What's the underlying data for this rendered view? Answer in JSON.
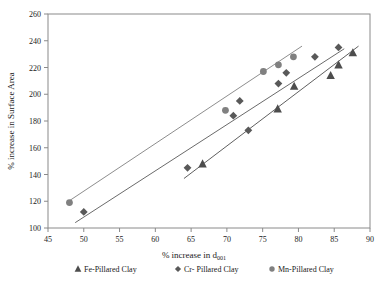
{
  "chart_data": {
    "type": "scatter",
    "title": "",
    "xlabel": "% increase in d001",
    "xlabel_main": "% increase in d",
    "xlabel_sub": "001",
    "ylabel": "% increase in Surface Area",
    "xlim": [
      45,
      90
    ],
    "ylim": [
      100,
      260
    ],
    "xticks": [
      45,
      50,
      55,
      60,
      65,
      70,
      75,
      80,
      85,
      90
    ],
    "yticks": [
      100,
      120,
      140,
      160,
      180,
      200,
      220,
      240,
      260
    ],
    "grid": false,
    "legend_position": "bottom",
    "series": [
      {
        "name": "Fe-Pillared Clay",
        "marker": "triangle",
        "color": "#4d4d4d",
        "points": [
          {
            "x": 66.6,
            "y": 148
          },
          {
            "x": 77.1,
            "y": 189
          },
          {
            "x": 79.4,
            "y": 206
          },
          {
            "x": 84.5,
            "y": 214
          },
          {
            "x": 85.6,
            "y": 222
          },
          {
            "x": 87.6,
            "y": 231
          }
        ],
        "trendline": {
          "x1": 64.0,
          "y1": 137,
          "x2": 88.4,
          "y2": 236
        }
      },
      {
        "name": "Cr- Pillared Clay",
        "marker": "diamond",
        "color": "#595959",
        "points": [
          {
            "x": 50.0,
            "y": 112
          },
          {
            "x": 64.5,
            "y": 145
          },
          {
            "x": 70.9,
            "y": 184
          },
          {
            "x": 71.8,
            "y": 195
          },
          {
            "x": 73.0,
            "y": 173
          },
          {
            "x": 77.2,
            "y": 208
          },
          {
            "x": 78.3,
            "y": 216
          },
          {
            "x": 82.3,
            "y": 228
          },
          {
            "x": 85.6,
            "y": 235
          }
        ],
        "trendline": {
          "x1": 48.8,
          "y1": 104,
          "x2": 86.4,
          "y2": 234
        }
      },
      {
        "name": "Mn-Pillared Clay",
        "marker": "circle",
        "color": "#808080",
        "points": [
          {
            "x": 48.0,
            "y": 119
          },
          {
            "x": 69.8,
            "y": 188
          },
          {
            "x": 75.1,
            "y": 217
          },
          {
            "x": 77.2,
            "y": 222
          },
          {
            "x": 79.3,
            "y": 228
          }
        ],
        "trendline": {
          "x1": 47.6,
          "y1": 119,
          "x2": 80.5,
          "y2": 236
        }
      }
    ]
  },
  "legend": {
    "items": [
      {
        "label": "Fe-Pillared Clay",
        "marker": "triangle",
        "color": "#4d4d4d"
      },
      {
        "label": "Cr- Pillared Clay",
        "marker": "diamond",
        "color": "#595959"
      },
      {
        "label": "Mn-Pillared Clay",
        "marker": "circle",
        "color": "#808080"
      }
    ]
  },
  "ticks": {
    "x": [
      "45",
      "50",
      "55",
      "60",
      "65",
      "70",
      "75",
      "80",
      "85",
      "90"
    ],
    "y": [
      "100",
      "120",
      "140",
      "160",
      "180",
      "200",
      "220",
      "240",
      "260"
    ]
  }
}
